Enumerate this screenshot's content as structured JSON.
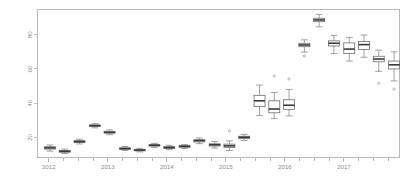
{
  "chart_data": {
    "type": "boxplot",
    "title": "",
    "subtitle": "",
    "xlabel": "",
    "ylabel": "",
    "xlim": [
      2011.8,
      2017.95
    ],
    "ylim": [
      8,
      95
    ],
    "grid": false,
    "legend": null,
    "y_ticks": [
      20,
      40,
      60,
      80
    ],
    "y_tick_labels": [
      "20",
      "40",
      "60",
      "80"
    ],
    "y_tick_orientation": "rotated-90",
    "x_ticks": [
      2012,
      2013,
      2014,
      2015,
      2016,
      2017
    ],
    "x_tick_labels": [
      "2012",
      "2013",
      "2014",
      "2015",
      "2016",
      "2017"
    ],
    "x_minor_ticks": [
      2012.25,
      2012.5,
      2012.75,
      2013.25,
      2013.5,
      2013.75,
      2014.25,
      2014.5,
      2014.75,
      2015.25,
      2015.5,
      2015.75,
      2016.25,
      2016.5,
      2016.75,
      2017.25,
      2017.5,
      2017.75
    ],
    "box_fill": "#ffffff",
    "box_stroke": "#6b6b6b",
    "median_color": "#3a3a3a",
    "whisker_color": "#8a8a8a",
    "outlier_color": "#9a9a9a",
    "axis_color": "#b9b9b9",
    "label_color": "#8d8d8d",
    "boxes": [
      {
        "x": 2012.02,
        "min": 12.0,
        "q1": 13.2,
        "median": 13.9,
        "q3": 14.6,
        "max": 15.6,
        "outliers": []
      },
      {
        "x": 2012.27,
        "min": 10.6,
        "q1": 11.4,
        "median": 11.9,
        "q3": 12.4,
        "max": 13.2,
        "outliers": []
      },
      {
        "x": 2012.52,
        "min": 16.2,
        "q1": 17.1,
        "median": 17.6,
        "q3": 18.1,
        "max": 19.0,
        "outliers": []
      },
      {
        "x": 2012.78,
        "min": 25.6,
        "q1": 26.4,
        "median": 26.9,
        "q3": 27.3,
        "max": 28.0,
        "outliers": []
      },
      {
        "x": 2013.03,
        "min": 21.6,
        "q1": 22.5,
        "median": 23.0,
        "q3": 23.6,
        "max": 24.4,
        "outliers": []
      },
      {
        "x": 2013.29,
        "min": 12.4,
        "q1": 13.1,
        "median": 13.5,
        "q3": 13.9,
        "max": 14.7,
        "outliers": []
      },
      {
        "x": 2013.54,
        "min": 11.6,
        "q1": 12.2,
        "median": 12.6,
        "q3": 13.0,
        "max": 13.6,
        "outliers": []
      },
      {
        "x": 2013.79,
        "min": 14.2,
        "q1": 15.0,
        "median": 15.4,
        "q3": 15.8,
        "max": 16.5,
        "outliers": []
      },
      {
        "x": 2014.04,
        "min": 12.8,
        "q1": 13.6,
        "median": 14.1,
        "q3": 14.6,
        "max": 15.4,
        "outliers": []
      },
      {
        "x": 2014.3,
        "min": 13.6,
        "q1": 14.3,
        "median": 14.8,
        "q3": 15.2,
        "max": 15.9,
        "outliers": []
      },
      {
        "x": 2014.55,
        "min": 16.4,
        "q1": 17.4,
        "median": 18.1,
        "q3": 18.7,
        "max": 19.7,
        "outliers": []
      },
      {
        "x": 2014.81,
        "min": 13.8,
        "q1": 15.0,
        "median": 15.7,
        "q3": 16.3,
        "max": 17.6,
        "outliers": []
      },
      {
        "x": 2015.06,
        "min": 12.4,
        "q1": 14.2,
        "median": 15.1,
        "q3": 16.1,
        "max": 18.0,
        "outliers": [
          23.8
        ]
      },
      {
        "x": 2015.31,
        "min": 18.2,
        "q1": 19.4,
        "median": 20.1,
        "q3": 20.7,
        "max": 21.8,
        "outliers": []
      },
      {
        "x": 2015.57,
        "min": 32.8,
        "q1": 38.0,
        "median": 41.4,
        "q3": 44.6,
        "max": 50.6,
        "outliers": []
      },
      {
        "x": 2015.82,
        "min": 31.0,
        "q1": 34.4,
        "median": 36.6,
        "q3": 41.4,
        "max": 46.2,
        "outliers": [
          55.8
        ]
      },
      {
        "x": 2016.07,
        "min": 32.6,
        "q1": 36.4,
        "median": 38.8,
        "q3": 42.0,
        "max": 48.0,
        "outliers": [
          54.2
        ]
      },
      {
        "x": 2016.33,
        "min": 69.8,
        "q1": 73.0,
        "median": 74.0,
        "q3": 75.0,
        "max": 77.0,
        "outliers": [
          67.6
        ]
      },
      {
        "x": 2016.58,
        "min": 84.6,
        "q1": 87.6,
        "median": 88.6,
        "q3": 89.6,
        "max": 91.8,
        "outliers": []
      },
      {
        "x": 2016.83,
        "min": 69.0,
        "q1": 73.4,
        "median": 75.0,
        "q3": 76.4,
        "max": 79.6,
        "outliers": []
      },
      {
        "x": 2017.09,
        "min": 64.6,
        "q1": 69.0,
        "median": 71.6,
        "q3": 75.2,
        "max": 78.4,
        "outliers": []
      },
      {
        "x": 2017.34,
        "min": 66.8,
        "q1": 71.4,
        "median": 74.2,
        "q3": 76.0,
        "max": 79.8,
        "outliers": []
      },
      {
        "x": 2017.59,
        "min": 58.6,
        "q1": 64.2,
        "median": 65.8,
        "q3": 67.4,
        "max": 71.0,
        "outliers": [
          51.6
        ]
      },
      {
        "x": 2017.85,
        "min": 53.0,
        "q1": 60.0,
        "median": 62.4,
        "q3": 64.6,
        "max": 70.0,
        "outliers": [
          48.2
        ]
      }
    ]
  },
  "plot_geometry": {
    "frame_left": 37,
    "frame_right": 400,
    "frame_top": 9,
    "frame_bottom": 158,
    "box_width_px": 11
  }
}
